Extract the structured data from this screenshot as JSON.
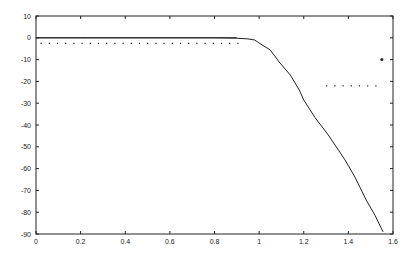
{
  "chart_data": {
    "type": "line",
    "title": "",
    "xlabel": "",
    "ylabel": "",
    "xlim": [
      0,
      1.6
    ],
    "ylim": [
      -90,
      10
    ],
    "x_ticks": [
      "0",
      "0.2",
      "0.4",
      "0.6",
      "0.8",
      "1",
      "1.2",
      "1.4",
      "1.6"
    ],
    "x_tick_values": [
      0,
      0.2,
      0.4,
      0.6,
      0.8,
      1.0,
      1.2,
      1.4,
      1.6
    ],
    "y_ticks": [
      "10",
      "0",
      "-10",
      "-20",
      "-30",
      "-40",
      "-50",
      "-60",
      "-70",
      "-80",
      "-90"
    ],
    "y_tick_values": [
      10,
      0,
      -10,
      -20,
      -30,
      -40,
      -50,
      -60,
      -70,
      -80,
      -90
    ],
    "grid": false,
    "legend": null,
    "series": [
      {
        "name": "response",
        "style": "solid",
        "color": "#222222",
        "x": [
          0,
          0.2,
          0.4,
          0.6,
          0.8,
          0.9,
          0.95,
          0.98,
          1.0,
          1.05,
          1.09,
          1.14,
          1.18,
          1.2,
          1.25,
          1.31,
          1.385,
          1.43,
          1.48,
          1.52,
          1.555
        ],
        "y": [
          0,
          0,
          0,
          0,
          0,
          -0.2,
          -0.5,
          -1.0,
          -2.4,
          -5.6,
          -11.1,
          -17.1,
          -24.0,
          -28.5,
          -36.5,
          -44.6,
          -56.0,
          -64.0,
          -74.4,
          -81.5,
          -89.0
        ]
      },
      {
        "name": "passband-spec",
        "style": "dotted",
        "color": "#222222",
        "x": [
          0.02,
          0.92
        ],
        "y": [
          -2.5,
          -2.5
        ]
      },
      {
        "name": "stopband-spec",
        "style": "dotted",
        "color": "#222222",
        "x": [
          1.3,
          1.54
        ],
        "y": [
          -22,
          -22
        ]
      },
      {
        "name": "marker",
        "style": "point",
        "color": "#222222",
        "x": [
          1.55
        ],
        "y": [
          -10
        ]
      }
    ]
  }
}
